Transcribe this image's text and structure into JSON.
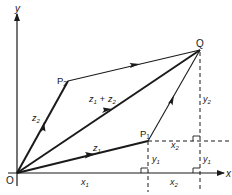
{
  "diagram": {
    "points": {
      "origin": {
        "label": "O",
        "x": 17,
        "y": 173
      },
      "P1": {
        "label": "P",
        "sub": "1",
        "x": 148,
        "y": 141
      },
      "P2": {
        "label": "P",
        "sub": "2",
        "x": 68,
        "y": 81
      },
      "Q": {
        "label": "Q",
        "x": 200,
        "y": 50
      }
    },
    "axes": {
      "x_label": "x",
      "y_label": "y"
    },
    "vectors": [
      {
        "name": "z1",
        "label": "z",
        "sub": "1"
      },
      {
        "name": "z2",
        "label": "z",
        "sub": "2"
      },
      {
        "name": "z1_plus_z2",
        "label": "z",
        "sub": "1",
        "plus": "+",
        "label2": "z",
        "sub2": "2"
      }
    ],
    "segments": {
      "x1": {
        "label": "x",
        "sub": "1"
      },
      "x2_bottom": {
        "label": "x",
        "sub": "2"
      },
      "x2_top": {
        "label": "x",
        "sub": "2"
      },
      "y1_left": {
        "label": "y",
        "sub": "1"
      },
      "y1_right": {
        "label": "y",
        "sub": "1"
      },
      "y2": {
        "label": "y",
        "sub": "2"
      }
    },
    "colors": {
      "line": "#1a1a1a",
      "background": "#ffffff"
    }
  }
}
